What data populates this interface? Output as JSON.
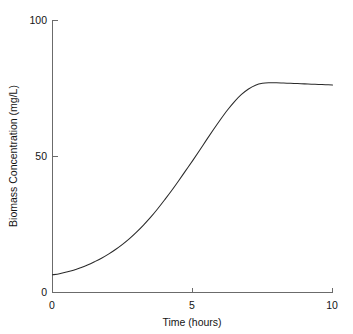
{
  "chart_data": {
    "type": "line",
    "title": "",
    "xlabel": "Time (hours)",
    "ylabel": "Biomass Concentration (mg/L)",
    "xlim": [
      0,
      10
    ],
    "ylim": [
      0,
      100
    ],
    "xticks": [
      0,
      5,
      10
    ],
    "xtick_labels": [
      "0",
      "5",
      "10"
    ],
    "yticks": [
      0,
      50,
      100
    ],
    "ytick_labels": [
      "0",
      "50",
      "100"
    ],
    "grid": false,
    "legend": false,
    "legend_position": "none",
    "line_color": "#2a2a2a",
    "background_color": "#ffffff",
    "axis_color": "#6b6b6b",
    "series": [
      {
        "name": "Biomass Concentration",
        "x": [
          0.0,
          0.25,
          0.5,
          0.75,
          1.0,
          1.25,
          1.5,
          1.75,
          2.0,
          2.25,
          2.5,
          2.75,
          3.0,
          3.25,
          3.5,
          3.75,
          4.0,
          4.25,
          4.5,
          4.75,
          5.0,
          5.25,
          5.5,
          5.75,
          6.0,
          6.25,
          6.5,
          6.75,
          7.0,
          7.25,
          7.5,
          7.75,
          8.0,
          8.25,
          8.5,
          8.75,
          9.0,
          9.25,
          9.5,
          9.75,
          10.0
        ],
        "y": [
          6.5,
          6.9,
          7.5,
          8.2,
          9.1,
          10.1,
          11.3,
          12.6,
          14.1,
          15.8,
          17.7,
          19.8,
          22.2,
          24.8,
          27.6,
          30.7,
          34.0,
          37.4,
          41.0,
          44.7,
          48.4,
          52.2,
          56.1,
          59.9,
          63.6,
          67.1,
          70.2,
          72.8,
          74.8,
          76.2,
          76.9,
          77.1,
          77.1,
          77.0,
          76.9,
          76.8,
          76.7,
          76.6,
          76.5,
          76.4,
          76.3
        ]
      }
    ]
  },
  "axes": {
    "y_title": "Biomass Concentration (mg/L)",
    "x_title": "Time (hours)",
    "y_tick_top": "100",
    "y_tick_mid": "50",
    "y_tick_bottom": "0",
    "x_tick_left": "0",
    "x_tick_mid": "5",
    "x_tick_right": "10"
  }
}
